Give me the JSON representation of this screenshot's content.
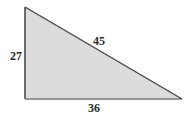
{
  "figure": {
    "type": "right-triangle",
    "fill_color": "#dcdcdc",
    "stroke_color": "#4a4a4a",
    "background_color": "#ffffff",
    "label_color": "#2b2b2b",
    "vertices": {
      "apex": [
        25,
        7
      ],
      "bottom_left": [
        25,
        99
      ],
      "bottom_right": [
        182,
        99
      ]
    },
    "labels": {
      "vertical_leg": "27",
      "hypotenuse": "45",
      "horizontal_leg": "36"
    }
  }
}
